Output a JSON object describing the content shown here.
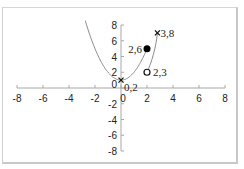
{
  "chart_data": {
    "type": "scatter",
    "title": "",
    "xlabel": "",
    "ylabel": "",
    "xlim": [
      -8,
      8
    ],
    "ylim": [
      -8,
      8
    ],
    "grid": false,
    "legend": null,
    "x_ticks": [
      "-8",
      "-6",
      "-4",
      "-2",
      "0",
      "2",
      "4",
      "6",
      "8"
    ],
    "y_ticks": [
      "8",
      "6",
      "4",
      "2",
      "0",
      "-2",
      "-4",
      "-6",
      "-8"
    ],
    "series": [
      {
        "name": "curve-left",
        "style": "line",
        "color": "#888888",
        "x": [
          -2.9,
          -2,
          -1,
          0,
          1,
          2
        ],
        "y": [
          8.2,
          5,
          2,
          1,
          2,
          5
        ]
      },
      {
        "name": "curve-right",
        "style": "line",
        "color": "#888888",
        "x": [
          2,
          2.3,
          2.6,
          2.8
        ],
        "y": [
          2,
          3.6,
          5.6,
          7
        ]
      }
    ],
    "points": [
      {
        "x": 0,
        "y": 1,
        "marker": "x",
        "label": "0,2"
      },
      {
        "x": 2,
        "y": 5,
        "marker": "filled-circle",
        "label": "2,6"
      },
      {
        "x": 2,
        "y": 2,
        "marker": "open-circle",
        "label": "2,3"
      },
      {
        "x": 2.8,
        "y": 7,
        "marker": "x",
        "label": "3,8"
      }
    ]
  }
}
